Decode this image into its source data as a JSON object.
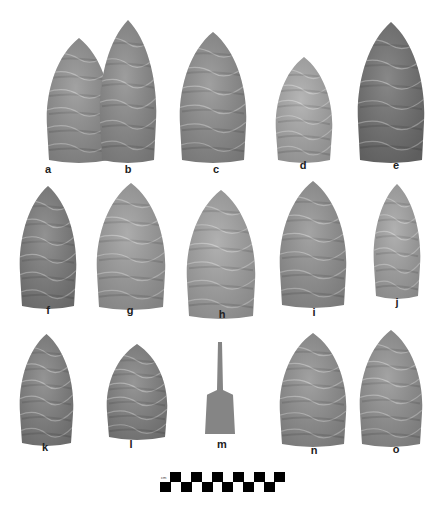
{
  "figure": {
    "specimens": [
      {
        "label": "a",
        "x": 45,
        "y": 38,
        "w": 68,
        "h": 126,
        "tone": "#8e8e8e"
      },
      {
        "label": "b",
        "x": 98,
        "y": 20,
        "w": 60,
        "h": 144,
        "tone": "#888888"
      },
      {
        "label": "c",
        "x": 178,
        "y": 32,
        "w": 70,
        "h": 132,
        "tone": "#8b8b8b"
      },
      {
        "label": "d",
        "x": 274,
        "y": 57,
        "w": 60,
        "h": 107,
        "tone": "#a6a6a6"
      },
      {
        "label": "e",
        "x": 356,
        "y": 22,
        "w": 70,
        "h": 142,
        "tone": "#6e6e6e"
      },
      {
        "label": "f",
        "x": 18,
        "y": 186,
        "w": 60,
        "h": 124,
        "tone": "#7a7a7a"
      },
      {
        "label": "g",
        "x": 95,
        "y": 183,
        "w": 72,
        "h": 128,
        "tone": "#9a9a9a"
      },
      {
        "label": "h",
        "x": 185,
        "y": 190,
        "w": 72,
        "h": 130,
        "tone": "#a0a0a0"
      },
      {
        "label": "i",
        "x": 278,
        "y": 181,
        "w": 70,
        "h": 128,
        "tone": "#909090"
      },
      {
        "label": "j",
        "x": 372,
        "y": 184,
        "w": 50,
        "h": 116,
        "tone": "#a0a0a0"
      },
      {
        "label": "k",
        "x": 18,
        "y": 334,
        "w": 57,
        "h": 113,
        "tone": "#7d7d7d"
      },
      {
        "label": "l",
        "x": 105,
        "y": 344,
        "w": 64,
        "h": 97,
        "tone": "#7f7f7f"
      },
      {
        "label": "n",
        "x": 278,
        "y": 333,
        "w": 70,
        "h": 115,
        "tone": "#8d8d8d"
      },
      {
        "label": "o",
        "x": 358,
        "y": 330,
        "w": 66,
        "h": 118,
        "tone": "#8f8f8f"
      }
    ],
    "special": {
      "label": "m",
      "x": 203,
      "y": 342,
      "w": 34,
      "h": 96,
      "tone": "#858585"
    },
    "labels": [
      {
        "text": "a",
        "x": 48,
        "y": 169
      },
      {
        "text": "b",
        "x": 128,
        "y": 169
      },
      {
        "text": "c",
        "x": 216,
        "y": 169
      },
      {
        "text": "d",
        "x": 303,
        "y": 165
      },
      {
        "text": "e",
        "x": 396,
        "y": 165
      },
      {
        "text": "f",
        "x": 48,
        "y": 310
      },
      {
        "text": "g",
        "x": 130,
        "y": 310
      },
      {
        "text": "h",
        "x": 222,
        "y": 314
      },
      {
        "text": "i",
        "x": 314,
        "y": 312
      },
      {
        "text": "j",
        "x": 397,
        "y": 302
      },
      {
        "text": "k",
        "x": 45,
        "y": 447
      },
      {
        "text": "l",
        "x": 131,
        "y": 444
      },
      {
        "text": "m",
        "x": 222,
        "y": 444
      },
      {
        "text": "n",
        "x": 314,
        "y": 450
      },
      {
        "text": "o",
        "x": 396,
        "y": 449
      }
    ],
    "scale_bar": {
      "unit": "cm",
      "segments": 12
    }
  }
}
